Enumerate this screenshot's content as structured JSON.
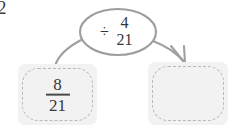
{
  "diagram": {
    "type": "fraction-division-flow",
    "problem_number": "2",
    "input": {
      "label": "8/21",
      "numerator": "8",
      "denominator": "21"
    },
    "operation": {
      "operator_symbol": "÷",
      "operand_numerator": "4",
      "operand_denominator": "21",
      "label": "÷ 4/21"
    },
    "output": {
      "label": "",
      "is_blank": true
    },
    "colors": {
      "card_fill": "#f2f2f2",
      "dashed_border": "#b9b9b9",
      "oval_stroke": "#9e9e9e",
      "arrow_stroke": "#9e9e9e",
      "text": "#37373a",
      "background": "#ffffff"
    }
  }
}
